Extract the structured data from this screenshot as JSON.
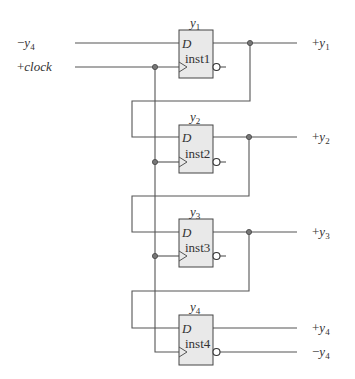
{
  "diagram": {
    "type": "shift-register / twisted-ring counter",
    "inputs": {
      "data_in": {
        "sign": "−",
        "name": "y",
        "sub": "4"
      },
      "clock": {
        "sign": "+",
        "name": "clock"
      }
    },
    "flip_flops": [
      {
        "title_name": "y",
        "title_sub": "1",
        "d_label": "D",
        "inst": "inst1",
        "out_sign": "+",
        "out_name": "y",
        "out_sub": "1"
      },
      {
        "title_name": "y",
        "title_sub": "2",
        "d_label": "D",
        "inst": "inst2",
        "out_sign": "+",
        "out_name": "y",
        "out_sub": "2"
      },
      {
        "title_name": "y",
        "title_sub": "3",
        "d_label": "D",
        "inst": "inst3",
        "out_sign": "+",
        "out_name": "y",
        "out_sub": "3"
      },
      {
        "title_name": "y",
        "title_sub": "4",
        "d_label": "D",
        "inst": "inst4",
        "out_sign": "+",
        "out_name": "y",
        "out_sub": "4"
      }
    ],
    "complement_output": {
      "sign": "−",
      "name": "y",
      "sub": "4"
    },
    "colors": {
      "wire": "#555555",
      "box_fill": "#e9e9e9",
      "box_stroke": "#444444",
      "text": "#333333"
    }
  }
}
